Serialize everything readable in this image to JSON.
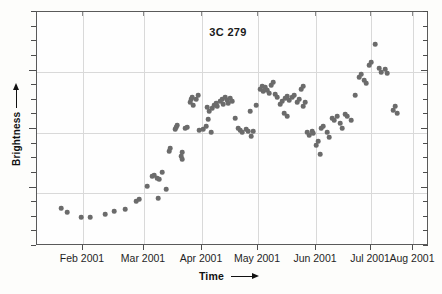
{
  "chart_data": {
    "type": "scatter",
    "title": "3C 279",
    "xlabel": "Time",
    "ylabel": "Brightness",
    "grid": true,
    "legend_position": "none",
    "xtick_labels": [
      "Feb 2001",
      "Mar 2001",
      "Apr 2001",
      "May 2001",
      "Jun 2001",
      "Jul 2001",
      "Aug 2001"
    ],
    "xtick_positions_px": [
      82,
      143,
      201,
      257,
      315,
      370,
      412
    ],
    "x_axis_range": [
      "2001-01-20",
      "2001-08-20"
    ],
    "ytick_count": 16,
    "y_gridline_positions_px": [
      71,
      132,
      192
    ],
    "ylim_note": "Brightness axis unlabeled (arbitrary units, increasing upward)",
    "point_count": 118,
    "marker_color": "#6b6b6b",
    "marker_shape": "circle",
    "points": [
      [
        60,
        207
      ],
      [
        66,
        211
      ],
      [
        80,
        216
      ],
      [
        89,
        216
      ],
      [
        104,
        213
      ],
      [
        113,
        210
      ],
      [
        124,
        208
      ],
      [
        135,
        200
      ],
      [
        138,
        198
      ],
      [
        146,
        185
      ],
      [
        151,
        175
      ],
      [
        153,
        174
      ],
      [
        156,
        177
      ],
      [
        158,
        178
      ],
      [
        161,
        171
      ],
      [
        165,
        188
      ],
      [
        168,
        150
      ],
      [
        169,
        147
      ],
      [
        174,
        128
      ],
      [
        175,
        126
      ],
      [
        176,
        124
      ],
      [
        180,
        155
      ],
      [
        181,
        151
      ],
      [
        181,
        158
      ],
      [
        184,
        127
      ],
      [
        186,
        126
      ],
      [
        189,
        101
      ],
      [
        190,
        98
      ],
      [
        191,
        96
      ],
      [
        192,
        104
      ],
      [
        195,
        98
      ],
      [
        197,
        94
      ],
      [
        198,
        129
      ],
      [
        202,
        128
      ],
      [
        205,
        125
      ],
      [
        206,
        106
      ],
      [
        208,
        110
      ],
      [
        211,
        107
      ],
      [
        213,
        104
      ],
      [
        215,
        102
      ],
      [
        216,
        105
      ],
      [
        219,
        100
      ],
      [
        221,
        98
      ],
      [
        222,
        103
      ],
      [
        224,
        96
      ],
      [
        226,
        99
      ],
      [
        227,
        102
      ],
      [
        229,
        97
      ],
      [
        231,
        100
      ],
      [
        207,
        118
      ],
      [
        210,
        131
      ],
      [
        234,
        117
      ],
      [
        237,
        127
      ],
      [
        239,
        129
      ],
      [
        241,
        131
      ],
      [
        245,
        128
      ],
      [
        247,
        130
      ],
      [
        250,
        135
      ],
      [
        252,
        130
      ],
      [
        249,
        110
      ],
      [
        255,
        104
      ],
      [
        259,
        88
      ],
      [
        261,
        85
      ],
      [
        262,
        90
      ],
      [
        264,
        86
      ],
      [
        266,
        89
      ],
      [
        268,
        92
      ],
      [
        270,
        84
      ],
      [
        272,
        81
      ],
      [
        274,
        93
      ],
      [
        276,
        96
      ],
      [
        279,
        103
      ],
      [
        281,
        100
      ],
      [
        284,
        97
      ],
      [
        286,
        95
      ],
      [
        288,
        99
      ],
      [
        291,
        96
      ],
      [
        293,
        94
      ],
      [
        283,
        112
      ],
      [
        286,
        115
      ],
      [
        296,
        101
      ],
      [
        298,
        98
      ],
      [
        302,
        105
      ],
      [
        304,
        101
      ],
      [
        306,
        131
      ],
      [
        308,
        134
      ],
      [
        311,
        130
      ],
      [
        312,
        132
      ],
      [
        315,
        144
      ],
      [
        317,
        140
      ],
      [
        320,
        127
      ],
      [
        322,
        125
      ],
      [
        326,
        131
      ],
      [
        328,
        136
      ],
      [
        331,
        117
      ],
      [
        333,
        119
      ],
      [
        336,
        115
      ],
      [
        339,
        122
      ],
      [
        341,
        127
      ],
      [
        344,
        113
      ],
      [
        346,
        115
      ],
      [
        350,
        119
      ],
      [
        354,
        94
      ],
      [
        358,
        76
      ],
      [
        360,
        73
      ],
      [
        363,
        79
      ],
      [
        365,
        82
      ],
      [
        368,
        64
      ],
      [
        370,
        61
      ],
      [
        374,
        43
      ],
      [
        378,
        67
      ],
      [
        380,
        71
      ],
      [
        384,
        68
      ],
      [
        386,
        72
      ],
      [
        392,
        109
      ],
      [
        394,
        105
      ],
      [
        396,
        112
      ],
      [
        300,
        88
      ],
      [
        302,
        85
      ],
      [
        319,
        153
      ],
      [
        157,
        197
      ]
    ]
  }
}
